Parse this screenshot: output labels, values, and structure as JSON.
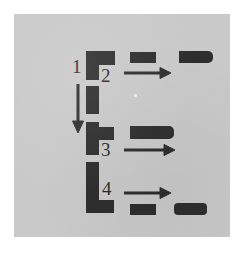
{
  "figure": {
    "kind": "process-flow-diagram",
    "background_color": "#ffffff",
    "plate_color": "#c9c9c9",
    "ink_color": "#2e2e2e",
    "step_numbers": [
      "1",
      "2",
      "3",
      "4"
    ],
    "labels": {
      "step1": "1",
      "step2": "2",
      "step3": "3",
      "step4": "4"
    },
    "arrows": {
      "down_arrow": "downward-arrow",
      "row1_arrow": "rightward-arrow",
      "row2_arrow": "rightward-arrow",
      "row3_arrow": "rightward-arrow"
    },
    "shapes": {
      "row1_left": "L-shaped-block",
      "row1_mid": "short-bar",
      "row1_right": "rounded-end-bar",
      "stem1": "vertical-bar",
      "row2_left": "T-shaped-block",
      "row2_right": "long-bar",
      "stem2": "vertical-bar",
      "row3_left": "corner-block",
      "row3_mid": "short-bar",
      "row3_right": "rounded-end-bar"
    }
  }
}
